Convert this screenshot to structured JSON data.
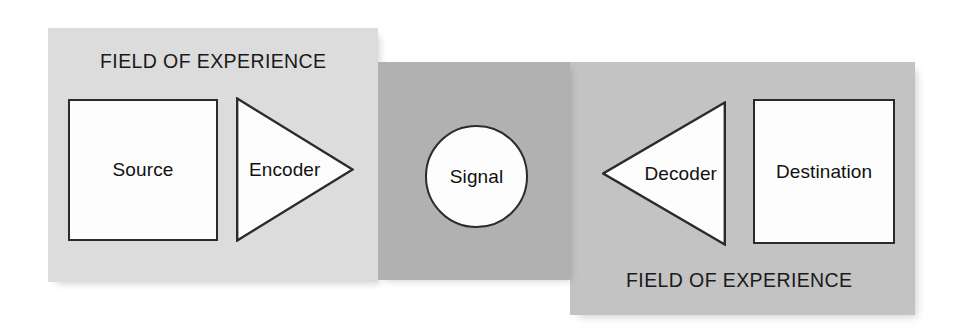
{
  "diagram": {
    "colors": {
      "sender_field_fill": "#dcdcdc",
      "channel_fill": "#b1b1b1",
      "receiver_field_fill": "#c3c3c3",
      "shape_fill": "#fdfdfd",
      "stroke": "#2b2b2b",
      "text": "#111111",
      "background": "#ffffff"
    },
    "fields": [
      {
        "id": "sender-field",
        "label": "FIELD OF EXPERIENCE",
        "label_position": "top"
      },
      {
        "id": "receiver-field",
        "label": "FIELD OF EXPERIENCE",
        "label_position": "bottom"
      }
    ],
    "channel": {
      "id": "channel-region",
      "label": ""
    },
    "nodes": [
      {
        "id": "source",
        "label": "Source",
        "shape": "square"
      },
      {
        "id": "encoder",
        "label": "Encoder",
        "shape": "triangle-right"
      },
      {
        "id": "signal",
        "label": "Signal",
        "shape": "circle"
      },
      {
        "id": "decoder",
        "label": "Decoder",
        "shape": "triangle-left"
      },
      {
        "id": "destination",
        "label": "Destination",
        "shape": "square"
      }
    ]
  }
}
